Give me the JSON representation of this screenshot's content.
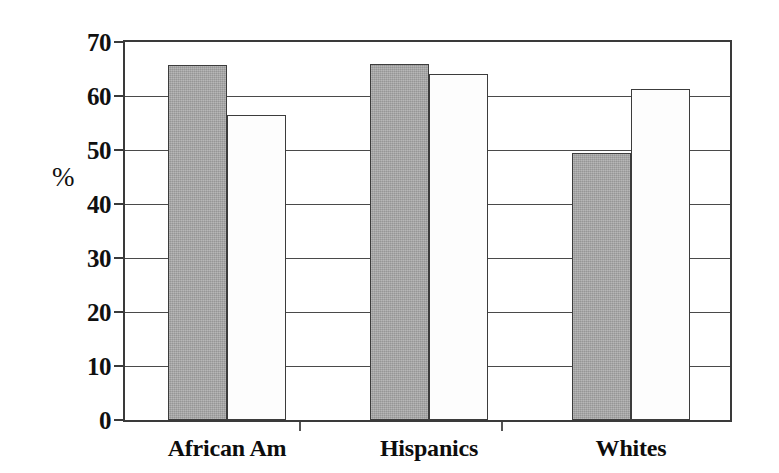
{
  "chart_data": {
    "type": "bar",
    "title": "",
    "subtitle": "",
    "xlabel": "",
    "ylabel": "%",
    "categories": [
      "African Am",
      "Hispanics",
      "Whites"
    ],
    "series": [
      {
        "name": "Series 1",
        "style": "filled-gray",
        "values": [
          65.7,
          66.0,
          49.5
        ]
      },
      {
        "name": "Series 2",
        "style": "open-white",
        "values": [
          56.5,
          64.0,
          61.3
        ]
      }
    ],
    "ylim": [
      0,
      70
    ],
    "ytick_labels": [
      "0",
      "10",
      "20",
      "30",
      "40",
      "50",
      "60",
      "70"
    ],
    "ytick_values": [
      0,
      10,
      20,
      30,
      40,
      50,
      60,
      70
    ],
    "grid": "horizontal",
    "legend": "none",
    "annotations": [],
    "colors": {
      "series1_fill": "#a7a7a7",
      "series2_fill": "#fdfdfd",
      "bar_outline": "#3c3c3c",
      "axis": "#3a3a3a",
      "gridline": "#4a4a4a",
      "text": "#101010",
      "background": "#ffffff"
    }
  },
  "axis": {
    "y_title": "%"
  }
}
